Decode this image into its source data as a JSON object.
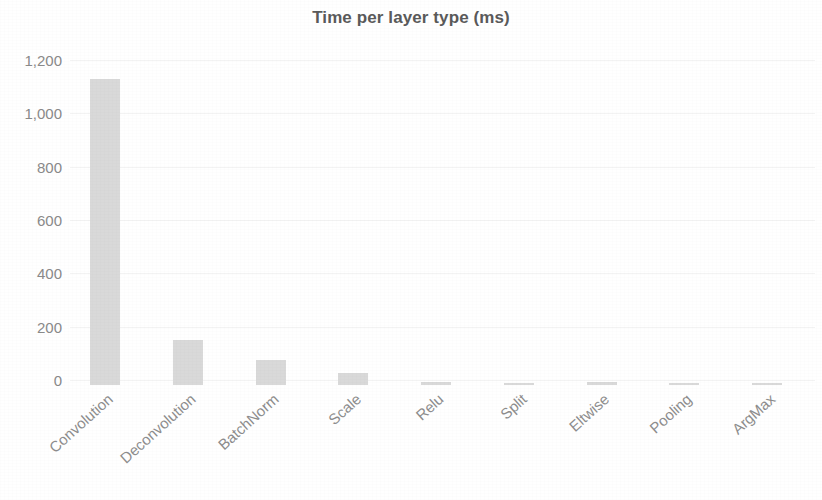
{
  "chart_data": {
    "type": "bar",
    "title": "Time per layer type (ms)",
    "xlabel": "",
    "ylabel": "",
    "categories": [
      "Convolution",
      "Deconvolution",
      "BatchNorm",
      "Scale",
      "Relu",
      "Split",
      "Eltwise",
      "Pooling",
      "ArgMax"
    ],
    "values": [
      1146,
      169,
      92,
      46,
      10,
      2,
      12,
      9,
      4
    ],
    "series": [
      {
        "name": "Time per layer type (ms)",
        "values": [
          1146,
          169,
          92,
          46,
          10,
          2,
          12,
          9,
          4
        ]
      }
    ],
    "ylim": [
      0,
      1200
    ],
    "y_ticks": [
      0,
      200,
      400,
      600,
      800,
      1000,
      1200
    ],
    "y_tick_labels": [
      "0",
      "200",
      "400",
      "600",
      "800",
      "1,000",
      "1,200"
    ],
    "grid": true,
    "grid_axis": "y",
    "legend": false,
    "legend_position": "none",
    "bar_color": "#d9d9d9",
    "title_color": "#5a5a5a",
    "tick_label_color": "#8a8a8a",
    "gridline_color": "#f3f3f3",
    "x_tick_rotation": -42
  }
}
